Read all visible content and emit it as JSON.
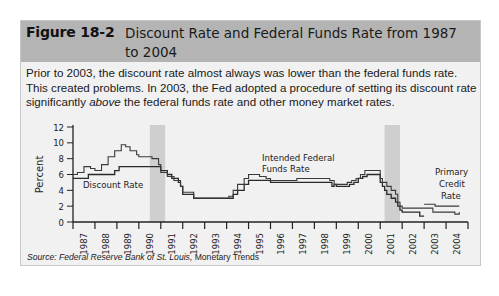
{
  "figure": {
    "number": "Figure 18-2",
    "title": "Discount Rate and Federal Funds Rate from 1987 to 2004",
    "caption_part1": "Prior to 2003, the discount rate almost always was lower than the federal funds rate. This created problems. In 2003, the Fed adopted a procedure of setting its discount rate significantly ",
    "caption_emph": "above",
    "caption_part2": " the federal funds rate and other money market rates.",
    "source_label": "Source: Federal Reserve Bank of St. Louis,",
    "source_pub": " Monetary Trends",
    "header_color": "#b4b4b4",
    "panel_color": "#f1f1f1"
  },
  "chart_data": {
    "type": "line",
    "title": "Discount Rate and Federal Funds Rate from 1987 to 2004",
    "xlabel": "",
    "ylabel": "Percent",
    "ylim": [
      0,
      12
    ],
    "xlim": [
      1987,
      2005
    ],
    "yticks": [
      0,
      2,
      4,
      6,
      8,
      10,
      12
    ],
    "xticks": [
      "1987",
      "1988",
      "1989",
      "1990",
      "1991",
      "1992",
      "1993",
      "1994",
      "1995",
      "1996",
      "1997",
      "1998",
      "1999",
      "2000",
      "2001",
      "2002",
      "2003",
      "2004"
    ],
    "grid": false,
    "recession_bands": [
      [
        1990.5,
        1991.2
      ],
      [
        2001.2,
        2001.9
      ]
    ],
    "annotations": [
      {
        "text": "Discount Rate",
        "x": 1987.3,
        "y": 4.7
      },
      {
        "text": "Intended Federal Funds Rate",
        "x": 1995.0,
        "y": 7.3
      },
      {
        "text": "Primary Credit Rate",
        "x": 2003.5,
        "y": 3.2
      }
    ],
    "series": [
      {
        "name": "Discount Rate",
        "x": [
          1987.0,
          1987.3,
          1987.7,
          1988.6,
          1988.9,
          1989.1,
          1990.0,
          1990.9,
          1991.0,
          1991.3,
          1991.5,
          1991.8,
          1991.9,
          1992.0,
          1992.5,
          1994.0,
          1994.3,
          1994.5,
          1994.8,
          1995.0,
          1995.1,
          1996.0,
          1998.8,
          1998.9,
          1999.0,
          1999.6,
          1999.8,
          2000.0,
          2000.2,
          2000.4,
          2000.9,
          2001.0,
          2001.1,
          2001.2,
          2001.3,
          2001.5,
          2001.7,
          2001.8,
          2001.9,
          2002.0,
          2002.8,
          2003.0
        ],
        "y": [
          5.5,
          5.5,
          6.0,
          6.0,
          6.5,
          7.0,
          7.0,
          7.0,
          6.5,
          6.0,
          5.5,
          5.0,
          4.5,
          3.5,
          3.0,
          3.0,
          3.5,
          4.0,
          4.75,
          5.25,
          5.25,
          5.0,
          4.5,
          4.75,
          4.5,
          4.75,
          5.0,
          5.5,
          5.75,
          6.0,
          6.0,
          5.0,
          4.5,
          4.0,
          3.5,
          3.0,
          2.5,
          2.0,
          1.5,
          1.25,
          0.75,
          0.75
        ]
      },
      {
        "name": "Intended Federal Funds Rate",
        "x": [
          1987.0,
          1987.2,
          1987.5,
          1987.8,
          1988.0,
          1988.3,
          1988.6,
          1988.9,
          1989.2,
          1989.4,
          1989.6,
          1989.9,
          1990.0,
          1990.6,
          1990.9,
          1991.0,
          1991.3,
          1991.6,
          1991.9,
          1992.0,
          1992.5,
          1993.9,
          1994.1,
          1994.3,
          1994.5,
          1994.8,
          1995.0,
          1995.5,
          1995.8,
          1996.0,
          1997.2,
          1998.7,
          1998.9,
          1999.0,
          1999.5,
          1999.7,
          1999.9,
          2000.1,
          2000.3,
          2000.9,
          2001.0,
          2001.1,
          2001.3,
          2001.5,
          2001.7,
          2001.8,
          2001.9,
          2002.0,
          2002.9,
          2003.4,
          2004.4,
          2004.6
        ],
        "y": [
          6.0,
          6.25,
          7.0,
          6.75,
          6.5,
          7.25,
          8.25,
          9.0,
          9.75,
          9.5,
          9.0,
          8.5,
          8.25,
          8.0,
          7.25,
          6.25,
          5.75,
          5.25,
          4.5,
          3.75,
          3.0,
          3.0,
          3.25,
          4.0,
          4.75,
          5.5,
          6.0,
          5.75,
          5.5,
          5.25,
          5.5,
          5.25,
          4.75,
          4.75,
          5.0,
          5.25,
          5.5,
          6.0,
          6.5,
          6.5,
          5.5,
          5.0,
          4.5,
          4.0,
          3.5,
          2.5,
          2.0,
          1.75,
          1.75,
          1.25,
          1.0,
          1.25
        ]
      },
      {
        "name": "Primary Credit Rate",
        "x": [
          2003.0,
          2003.5,
          2003.5,
          2004.6
        ],
        "y": [
          2.25,
          2.25,
          2.0,
          2.0
        ]
      }
    ]
  }
}
